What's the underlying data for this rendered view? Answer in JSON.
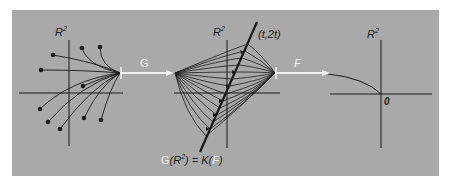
{
  "diagram": {
    "background_color": "#a9a9a9",
    "line_color": "#1a1a1a",
    "arrow_color": "#f2f2f2",
    "panels": [
      {
        "id": "domain",
        "axis_label": "R",
        "axis_label_sup": "2"
      },
      {
        "id": "middle",
        "axis_label": "R",
        "axis_label_sup": "2",
        "line_label": "(t,2t)"
      },
      {
        "id": "target",
        "axis_label": "R",
        "axis_label_sup": "2",
        "origin_label": "0"
      }
    ],
    "arrows": [
      {
        "id": "G",
        "label": "G"
      },
      {
        "id": "F",
        "label": "F"
      }
    ],
    "caption": {
      "G": "G",
      "open1": "(R",
      "sup": "2",
      "close1": ") = K(",
      "F": "F",
      "close2": ")"
    }
  }
}
